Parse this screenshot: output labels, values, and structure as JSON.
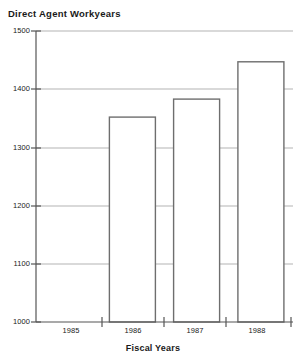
{
  "chart_data": {
    "type": "bar",
    "title": "Direct Agent Workyears",
    "xlabel": "Fiscal Years",
    "ylabel": "",
    "categories": [
      "1985",
      "1986",
      "1987",
      "1988"
    ],
    "values": [
      1272,
      1352,
      1383,
      1447
    ],
    "ylim": [
      1000,
      1500
    ],
    "ytick_labels": [
      "1500",
      "1400",
      "1300",
      "1200",
      "1100",
      "1000"
    ],
    "ytick_values": [
      1500,
      1400,
      1300,
      1200,
      1100,
      1000
    ],
    "grid": true,
    "legend": false,
    "bar_fill_color": "#ffffff",
    "bar_stroke_color": "#6e6e6e",
    "grid_color": "#b3b3b3",
    "axis_color": "#555555",
    "text_color": "#1a1a1a"
  }
}
